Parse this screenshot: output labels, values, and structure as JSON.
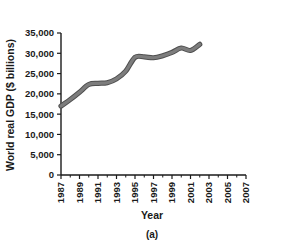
{
  "figure": {
    "caption": "(a)",
    "background_color": "#ffffff"
  },
  "chart_data": {
    "type": "line",
    "title": "",
    "xlabel": "Year",
    "ylabel": "World real GDP ($ billions)",
    "xlim": [
      1987,
      2007
    ],
    "ylim": [
      0,
      35000
    ],
    "grid": false,
    "legend": "none",
    "line_color": "#7d7d7d",
    "line_edge_color": "#4f4f4f",
    "axis_color": "#1a1a1a",
    "x_tick_labels": [
      "1987",
      "1989",
      "1991",
      "1993",
      "1995",
      "1997",
      "1999",
      "2001",
      "2003",
      "2005",
      "2007"
    ],
    "x_tick_values": [
      1987,
      1989,
      1991,
      1993,
      1995,
      1997,
      1999,
      2001,
      2003,
      2005,
      2007
    ],
    "x_minor_ticks": [
      1988,
      1990,
      1992,
      1994,
      1996,
      1998,
      2000,
      2002,
      2004,
      2006
    ],
    "y_tick_labels": [
      "0",
      "5,000",
      "10,000",
      "15,000",
      "20,000",
      "25,000",
      "30,000",
      "35,000"
    ],
    "y_tick_values": [
      0,
      5000,
      10000,
      15000,
      20000,
      25000,
      30000,
      35000
    ],
    "series": [
      {
        "name": "World real GDP",
        "x": [
          1987,
          1988,
          1989,
          1990,
          1991,
          1992,
          1993,
          1994,
          1995,
          1996,
          1997,
          1998,
          1999,
          2000,
          2001,
          2002
        ],
        "values": [
          17000,
          18600,
          20400,
          22300,
          22600,
          22750,
          23700,
          25600,
          29000,
          29100,
          28900,
          29400,
          30200,
          31300,
          30700,
          32200
        ]
      }
    ]
  }
}
